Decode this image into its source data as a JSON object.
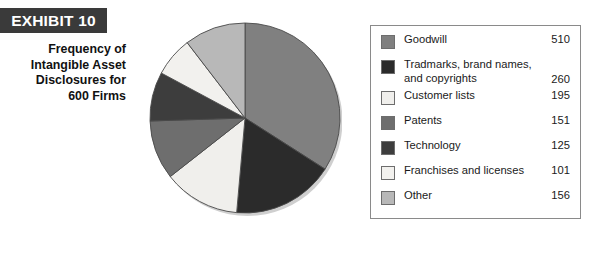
{
  "exhibit": {
    "banner_label": "EXHIBIT 10",
    "caption_lines": [
      "Frequency of",
      "Intangible Asset",
      "Disclosures for",
      "600 Firms"
    ]
  },
  "colors": {
    "banner_background": "#3a3a3a",
    "banner_text": "#ffffff",
    "legend_border": "#8a8a8a",
    "page_background": "#ffffff",
    "text": "#1a1a1a"
  },
  "chart_data": {
    "type": "pie",
    "title": "Frequency of Intangible Asset Disclosures for 600 Firms",
    "categories": [
      "Goodwill",
      "Tradmarks, brand names, and copyrights",
      "Customer lists",
      "Patents",
      "Technology",
      "Franchises and licenses",
      "Other"
    ],
    "values": [
      510,
      260,
      195,
      151,
      125,
      101,
      156
    ],
    "slice_colors": [
      "#808080",
      "#2b2b2b",
      "#f0efec",
      "#6e6e6e",
      "#3d3d3d",
      "#f2f1ee",
      "#b8b8b8"
    ],
    "total": 1498,
    "start_angle_deg": 0,
    "direction": "clockwise",
    "legend_position": "right",
    "grid": false,
    "xlabel": "",
    "ylabel": ""
  },
  "legend": {
    "entries": [
      {
        "label": "Goodwill",
        "value": "510",
        "color": "#808080"
      },
      {
        "label": "Tradmarks, brand names, and copyrights",
        "value": "260",
        "color": "#2b2b2b"
      },
      {
        "label": "Customer lists",
        "value": "195",
        "color": "#f0efec"
      },
      {
        "label": "Patents",
        "value": "151",
        "color": "#6e6e6e"
      },
      {
        "label": "Technology",
        "value": "125",
        "color": "#3d3d3d"
      },
      {
        "label": "Franchises and licenses",
        "value": "101",
        "color": "#f2f1ee"
      },
      {
        "label": "Other",
        "value": "156",
        "color": "#b8b8b8"
      }
    ],
    "entry_2_line_1": "Tradmarks, brand names,",
    "entry_2_line_2": "and copyrights"
  }
}
